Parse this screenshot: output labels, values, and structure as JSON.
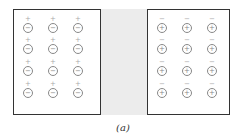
{
  "figure": {
    "caption": "(a)",
    "colors": {
      "border": "#333333",
      "gap_fill": "#ececec",
      "ring": "#888888",
      "sign": "#aaaaaa"
    },
    "left_region": {
      "outer_sign": "+",
      "inner_sign": "−",
      "rows": 4,
      "cols": 3,
      "col_x": [
        21,
        46,
        71
      ],
      "row_y": [
        15,
        36,
        58,
        80
      ]
    },
    "middle_region": {
      "label": ""
    },
    "right_region": {
      "outer_sign": "−",
      "inner_sign": "+",
      "rows": 4,
      "cols": 3,
      "col_x": [
        155,
        180,
        205
      ],
      "row_y": [
        15,
        36,
        58,
        80
      ]
    }
  }
}
